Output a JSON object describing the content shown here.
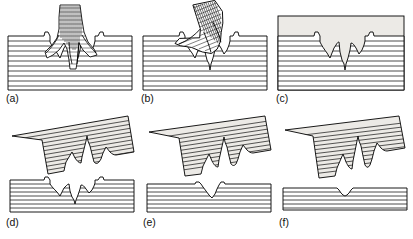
{
  "figure": {
    "panel_count": 6,
    "rows": 2,
    "columns": 3,
    "background_color": "#ffffff",
    "line_color": "#000000",
    "infill_fill_color": "#eceae6",
    "lamination_color": "#1a1a1a",
    "foot_shading_color": "#2b2b2b"
  },
  "panels": [
    {
      "id": "a",
      "label": "(a)",
      "caption_text": "(a)",
      "stage": "foot pressing down into laminated sediment",
      "has_foot": true,
      "foot_state": "pressed-in",
      "has_infill": false,
      "substrate_type": "laminated",
      "lamination_count": 10,
      "track_depth_relative": 1.0,
      "toe_count": 3
    },
    {
      "id": "b",
      "label": "(b)",
      "caption_text": "(b)",
      "stage": "foot withdrawn leaving true track",
      "has_foot": true,
      "foot_state": "lifting-off",
      "has_infill": false,
      "substrate_type": "laminated",
      "lamination_count": 10,
      "track_depth_relative": 1.0,
      "toe_count": 3
    },
    {
      "id": "c",
      "label": "(c)",
      "caption_text": "(c)",
      "stage": "track buried by overlying infill sediment",
      "has_foot": false,
      "foot_state": "absent",
      "has_infill": true,
      "substrate_type": "laminated",
      "lamination_count": 10,
      "track_depth_relative": 1.0,
      "toe_count": 3
    },
    {
      "id": "d",
      "label": "(d)",
      "caption_text": "(d)",
      "stage": "infill lifted as natural cast; erosion plane at true track level",
      "has_foot": false,
      "foot_state": "absent",
      "has_infill": true,
      "cast_lifted": true,
      "cast_tilt_degrees": -11,
      "substrate_type": "laminated",
      "lamination_count": 10,
      "track_depth_relative": 1.0,
      "toe_count": 3
    },
    {
      "id": "e",
      "label": "(e)",
      "caption_text": "(e)",
      "stage": "deeper erosion plane exposing shallower undertrack",
      "has_foot": false,
      "foot_state": "absent",
      "has_infill": true,
      "cast_lifted": true,
      "cast_tilt_degrees": -13,
      "substrate_type": "laminated",
      "lamination_count": 8,
      "track_depth_relative": 0.45,
      "toe_count": 3
    },
    {
      "id": "f",
      "label": "(f)",
      "caption_text": "(f)",
      "stage": "deepest erosion plane leaving faint undertrack remnant",
      "has_foot": false,
      "foot_state": "absent",
      "has_infill": true,
      "cast_lifted": true,
      "cast_tilt_degrees": -15,
      "substrate_type": "laminated",
      "lamination_count": 6,
      "track_depth_relative": 0.15,
      "toe_count": 3
    }
  ]
}
